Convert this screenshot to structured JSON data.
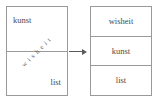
{
  "diagram": {
    "type": "transformation-diagram",
    "left_box": {
      "name": "unsorted-box",
      "cells": [
        {
          "label": "kunst",
          "position": "top-left"
        },
        {
          "label": "list",
          "position": "bottom-right"
        }
      ],
      "diagonal_label": "wisheit",
      "divider_count": 1
    },
    "arrow": {
      "name": "transform-arrow",
      "direction": "right",
      "glyph": "→"
    },
    "right_box": {
      "name": "sorted-box",
      "rows": [
        {
          "label": "wisheit"
        },
        {
          "label": "kunst"
        },
        {
          "label": "list"
        }
      ]
    },
    "colors": {
      "border": "#9a9a9a",
      "text": "#4a4a4a",
      "arrow": "#5a5a5a",
      "background": "#ffffff"
    }
  }
}
